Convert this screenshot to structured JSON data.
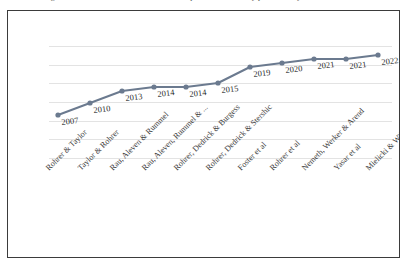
{
  "caption": {
    "fragment": "Figure 1. Timeline of studies on interleaved practice, ordered by publication year"
  },
  "chart_data": {
    "type": "line",
    "title": "",
    "xlabel": "",
    "ylabel": "",
    "grid": true,
    "gridlines": 7,
    "legend": false,
    "categories": [
      "Rohrer & Taylor",
      "Taylor & Rohrer",
      "Rau, Aleven & Rummel",
      "Rau, Aleven, Rummel & ...",
      "Rohrer, Dedrick & Burgess",
      "Rohrer, Dedrick & Stershic",
      "Foster et al",
      "Rohrer et al",
      "Nemeth, Werker & Arend",
      "Yasar et al",
      "Mielicki & Wiley"
    ],
    "point_labels": [
      "2007",
      "2010",
      "2013",
      "2014",
      "2014",
      "2015",
      "2019",
      "2020",
      "2021",
      "2021",
      "2022"
    ],
    "values": [
      2007,
      2010,
      2013,
      2014,
      2014,
      2015,
      2019,
      2020,
      2021,
      2021,
      2022
    ],
    "ylim": [
      2005,
      2023
    ],
    "series_color": "#6b7a8f",
    "marker_color": "#6b7a8f",
    "grid_color": "#e3e3e3",
    "frame_color": "#3b3b3b"
  }
}
